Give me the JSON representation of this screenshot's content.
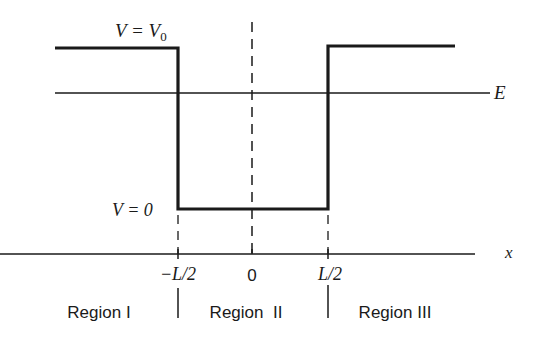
{
  "diagram": {
    "labels": {
      "v_high": "V = V",
      "v_high_sub": "0",
      "v_low": "V = 0",
      "energy": "E",
      "x_axis": "x"
    },
    "ticks": [
      "−L/2",
      "0",
      "L/2"
    ],
    "regions": [
      "Region I",
      "Region  II",
      "Region III"
    ],
    "colors": {
      "line": "#1a1a1a",
      "background": "#ffffff"
    }
  }
}
